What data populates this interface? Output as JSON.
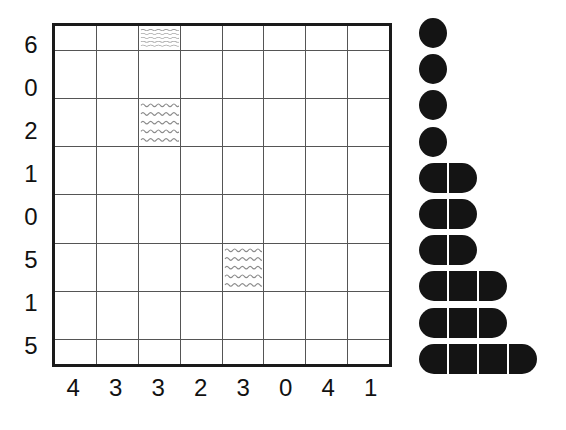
{
  "chart_data": {
    "type": "table",
    "title": "",
    "grid": {
      "rows": 8,
      "cols": 8,
      "row_labels": [
        "6",
        "0",
        "2",
        "1",
        "0",
        "5",
        "1",
        "5"
      ],
      "col_labels": [
        "4",
        "3",
        "3",
        "2",
        "3",
        "0",
        "4",
        "1"
      ],
      "marked_cells": [
        {
          "row": 0,
          "col": 2,
          "pattern": "wavy"
        },
        {
          "row": 2,
          "col": 2,
          "pattern": "wavy"
        },
        {
          "row": 5,
          "col": 4,
          "pattern": "wavy"
        }
      ],
      "border_color": "#1a1a1a",
      "line_color": "#555555",
      "cell_fill": "#ffffff",
      "marked_pattern_color": "#8a8a8a"
    },
    "segment_chart": {
      "description": "Rows of black rounded segments forming a staircase",
      "shape_color": "#141414",
      "row_counts": [
        1,
        1,
        1,
        1,
        2,
        2,
        2,
        3,
        3,
        4
      ],
      "rows": 10,
      "max_count": 4
    }
  },
  "grid": {
    "row_labels": [
      "6",
      "0",
      "2",
      "1",
      "0",
      "5",
      "1",
      "5"
    ],
    "col_labels": [
      "4",
      "3",
      "3",
      "2",
      "3",
      "0",
      "4",
      "1"
    ]
  },
  "segments": {
    "row_counts": [
      1,
      1,
      1,
      1,
      2,
      2,
      2,
      3,
      3,
      4
    ]
  }
}
